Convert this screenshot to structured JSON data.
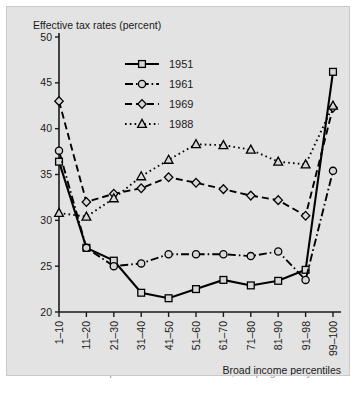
{
  "figure": {
    "background_color": "#e3e3e3",
    "axis_color": "#1a1a1a",
    "title": "Effective tax rates (percent)",
    "xlabel": "Broad income percentiles"
  },
  "caption": {
    "text": "Effective tax rates for all percentiles of broad income, this progressivity"
  },
  "legend": {
    "position": "top-center-left",
    "items": [
      {
        "label": "1951",
        "marker": "square",
        "line": "solid",
        "color": "#000000"
      },
      {
        "label": "1961",
        "marker": "circle",
        "line": "dashdot",
        "color": "#000000"
      },
      {
        "label": "1969",
        "marker": "diamond",
        "line": "dashed",
        "color": "#000000"
      },
      {
        "label": "1988",
        "marker": "triangle",
        "line": "dotted",
        "color": "#000000"
      }
    ]
  },
  "chart_data": {
    "type": "line",
    "title": "Effective tax rates (percent)",
    "xlabel": "Broad income percentiles",
    "ylabel": "",
    "grid": false,
    "legend_position": "upper-left-inside",
    "ylim": [
      20,
      50
    ],
    "yticks": [
      20,
      25,
      30,
      35,
      40,
      45,
      50
    ],
    "categories": [
      "1–10",
      "11–20",
      "21–30",
      "31–40",
      "41–50",
      "51–60",
      "61–70",
      "71–80",
      "81–90",
      "91–98",
      "99–100"
    ],
    "series": [
      {
        "name": "1951",
        "marker": "square",
        "line": "solid",
        "values": [
          36.4,
          27.0,
          25.6,
          22.1,
          21.5,
          22.5,
          23.5,
          22.9,
          23.4,
          24.6,
          46.2
        ]
      },
      {
        "name": "1961",
        "marker": "circle",
        "line": "dashdot",
        "values": [
          37.6,
          27.0,
          25.0,
          25.3,
          26.3,
          26.3,
          26.3,
          26.1,
          26.6,
          23.5,
          35.4
        ]
      },
      {
        "name": "1969",
        "marker": "diamond",
        "line": "dashed",
        "values": [
          43.0,
          32.0,
          32.9,
          33.5,
          34.7,
          34.1,
          33.4,
          32.7,
          32.2,
          30.5,
          42.3
        ]
      },
      {
        "name": "1988",
        "marker": "triangle",
        "line": "dotted",
        "values": [
          30.8,
          30.4,
          32.4,
          34.8,
          36.6,
          38.3,
          38.2,
          37.7,
          36.4,
          36.1,
          42.5
        ]
      }
    ]
  }
}
